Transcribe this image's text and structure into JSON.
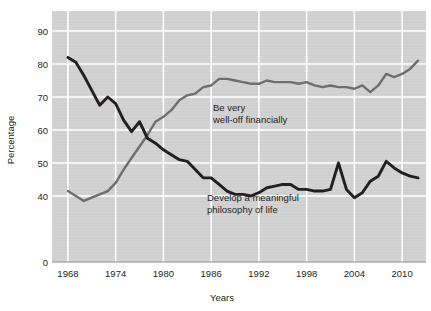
{
  "chart_data": {
    "type": "line",
    "title": "",
    "xlabel": "Years",
    "ylabel": "Percentage",
    "grid": true,
    "legend_position": "inline-annotation",
    "xlim": [
      1966,
      2013
    ],
    "ylim": [
      36,
      93
    ],
    "yticks": [
      0,
      40,
      50,
      60,
      70,
      80,
      90
    ],
    "ytick_labels": [
      "0",
      "40",
      "50",
      "60",
      "70",
      "80",
      "90"
    ],
    "y_axis_break": true,
    "xticks": [
      1968,
      1974,
      1980,
      1986,
      1992,
      1998,
      2004,
      2010
    ],
    "xtick_labels": [
      "1968",
      "1974",
      "1980",
      "1986",
      "1992",
      "1998",
      "2004",
      "2010"
    ],
    "plot_bg": "#d4d4d4",
    "grid_color": "#ffffff",
    "series": [
      {
        "name": "Be very well-off financially",
        "color": "#6e6e6e",
        "annotation": "Be very\nwell-off financially",
        "annotation_line1": "Be very",
        "annotation_line2": "well-off financially",
        "x": [
          1968,
          1969,
          1970,
          1971,
          1972,
          1973,
          1974,
          1975,
          1976,
          1977,
          1978,
          1979,
          1980,
          1981,
          1982,
          1983,
          1984,
          1985,
          1986,
          1987,
          1988,
          1989,
          1990,
          1991,
          1992,
          1993,
          1994,
          1995,
          1996,
          1997,
          1998,
          1999,
          2000,
          2001,
          2002,
          2003,
          2004,
          2005,
          2006,
          2007,
          2008,
          2009,
          2010,
          2011,
          2012
        ],
        "values": [
          41.5,
          40.0,
          38.5,
          39.5,
          40.5,
          41.5,
          44.0,
          48.0,
          51.5,
          55.0,
          58.5,
          62.5,
          64.0,
          66.0,
          69.0,
          70.5,
          71.0,
          73.0,
          73.5,
          75.5,
          75.5,
          75.0,
          74.5,
          74.0,
          74.0,
          75.0,
          74.5,
          74.5,
          74.5,
          74.0,
          74.5,
          73.5,
          73.0,
          73.5,
          73.0,
          73.0,
          72.5,
          73.5,
          71.5,
          73.5,
          77.0,
          76.0,
          77.0,
          78.5,
          81.0
        ]
      },
      {
        "name": "Develop a meaningful philosophy of life",
        "color": "#231f20",
        "annotation": "Develop a meaningful\nphilosophy of life",
        "annotation_line1": "Develop a meaningful",
        "annotation_line2": "philosophy of life",
        "x": [
          1968,
          1969,
          1970,
          1971,
          1972,
          1973,
          1974,
          1975,
          1976,
          1977,
          1978,
          1979,
          1980,
          1981,
          1982,
          1983,
          1984,
          1985,
          1986,
          1987,
          1988,
          1989,
          1990,
          1991,
          1992,
          1993,
          1994,
          1995,
          1996,
          1997,
          1998,
          1999,
          2000,
          2001,
          2002,
          2003,
          2004,
          2005,
          2006,
          2007,
          2008,
          2009,
          2010,
          2011,
          2012
        ],
        "values": [
          82.0,
          80.5,
          76.5,
          72.0,
          67.5,
          70.0,
          68.0,
          63.0,
          59.5,
          62.5,
          57.5,
          56.0,
          54.0,
          52.5,
          51.0,
          50.5,
          48.0,
          45.5,
          45.5,
          43.5,
          41.5,
          40.5,
          40.5,
          40.0,
          41.0,
          42.5,
          43.0,
          43.5,
          43.5,
          42.0,
          42.0,
          41.5,
          41.5,
          42.0,
          50.0,
          42.0,
          39.5,
          41.0,
          44.5,
          46.0,
          50.5,
          48.5,
          47.0,
          46.0,
          45.5
        ]
      }
    ]
  }
}
